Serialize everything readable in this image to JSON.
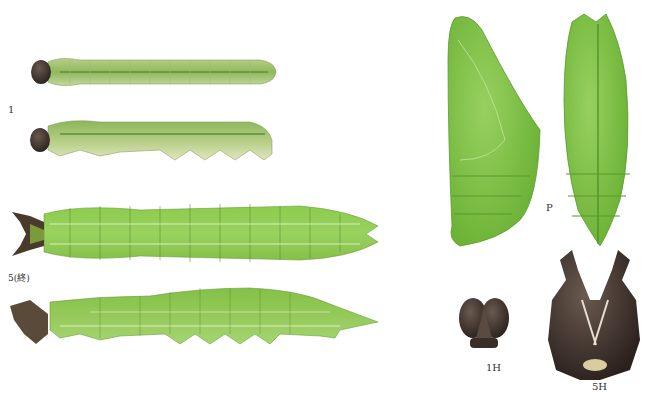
{
  "plate": {
    "labels": {
      "first_instar": "1",
      "final_instar": "5(終)",
      "pupa": "P",
      "first_instar_head": "1H",
      "final_instar_head": "5H"
    },
    "colors": {
      "larva_green": "#9cc46a",
      "larva_light": "#d8e2b0",
      "final_green": "#8cc850",
      "pupa_green": "#7cc444",
      "head_dark": "#3a2e28",
      "background": "#ffffff"
    }
  }
}
